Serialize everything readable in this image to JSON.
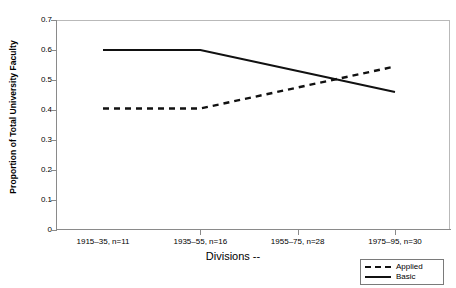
{
  "chart_data": {
    "type": "line",
    "title": "",
    "xlabel": "Divisions --",
    "ylabel": "Proportion of Total University Faculty",
    "categories": [
      "1915–35, n=11",
      "1935–55, n=16",
      "1955–75, n=28",
      "1975–95, n=30"
    ],
    "series": [
      {
        "name": "Applied",
        "style": "dashed",
        "color": "#111111",
        "values": [
          0.405,
          0.405,
          0.475,
          0.545
        ]
      },
      {
        "name": "Basic",
        "style": "solid",
        "color": "#111111",
        "values": [
          0.6,
          0.6,
          0.53,
          0.46
        ]
      }
    ],
    "ylim": [
      0,
      0.7
    ],
    "ytick_labels": [
      "0.7",
      "0.6",
      "0.5",
      "0.4",
      "0.3",
      "0.2",
      "0.1",
      "0"
    ],
    "ytick_values": [
      0.7,
      0.6,
      0.5,
      0.4,
      0.3,
      0.2,
      0.1,
      0
    ],
    "grid": false,
    "legend_position": "bottom-right"
  },
  "legend": {
    "entries": [
      {
        "label": "Applied",
        "style": "dashed"
      },
      {
        "label": "Basic",
        "style": "solid"
      }
    ]
  }
}
